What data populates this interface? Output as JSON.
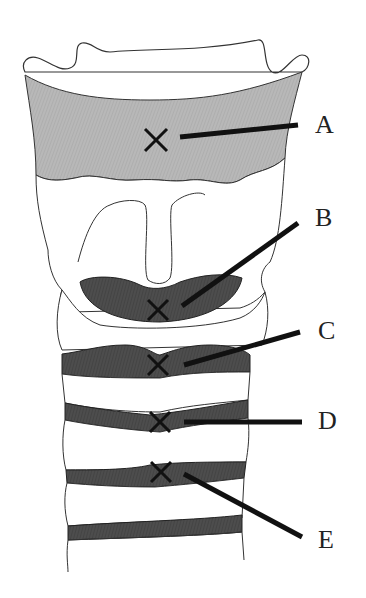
{
  "diagram": {
    "colors": {
      "background": "#ffffff",
      "outline": "#333333",
      "membrane_light": "#b3b3b3",
      "membrane_dark": "#4a4a4a",
      "marker": "#111111"
    },
    "labels": [
      {
        "id": "A",
        "text": "A",
        "x": 315,
        "y": 112
      },
      {
        "id": "B",
        "text": "B",
        "x": 315,
        "y": 205
      },
      {
        "id": "C",
        "text": "C",
        "x": 318,
        "y": 318
      },
      {
        "id": "D",
        "text": "D",
        "x": 318,
        "y": 408
      },
      {
        "id": "E",
        "text": "E",
        "x": 318,
        "y": 527
      }
    ],
    "markers": [
      {
        "id": "A",
        "x": 156,
        "y": 140
      },
      {
        "id": "B",
        "x": 158,
        "y": 310
      },
      {
        "id": "C",
        "x": 158,
        "y": 365
      },
      {
        "id": "D",
        "x": 160,
        "y": 422
      },
      {
        "id": "E",
        "x": 161,
        "y": 472
      }
    ]
  }
}
